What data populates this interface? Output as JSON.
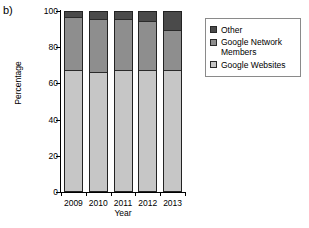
{
  "panel": {
    "label": "b)"
  },
  "chart_data": {
    "type": "bar",
    "subtype": "stacked-100-percent",
    "title": "",
    "xlabel": "Year",
    "ylabel": "Percentage",
    "categories": [
      "2009",
      "2010",
      "2011",
      "2012",
      "2013"
    ],
    "ylim": [
      0,
      100
    ],
    "yticks": [
      0,
      20,
      40,
      60,
      80,
      100
    ],
    "ytick_labels": [
      "0",
      "20",
      "40",
      "60",
      "80",
      "100"
    ],
    "grid": false,
    "legend_position": "right",
    "series": [
      {
        "name": "Google Websites",
        "color": "#c6c6c6",
        "values": [
          67,
          66,
          67,
          67,
          67
        ]
      },
      {
        "name": "Google Network Members",
        "color": "#8e8e8e",
        "values": [
          30,
          30,
          29,
          28,
          23
        ]
      },
      {
        "name": "Other",
        "color": "#4a4a4a",
        "values": [
          3,
          4,
          4,
          5,
          10
        ]
      }
    ],
    "stack_order_bottom_to_top": [
      "Google Websites",
      "Google Network Members",
      "Other"
    ]
  },
  "legend": {
    "items": [
      {
        "label": "Other",
        "color": "#4a4a4a"
      },
      {
        "label": "Google Network Members",
        "color": "#8e8e8e"
      },
      {
        "label": "Google Websites",
        "color": "#c6c6c6"
      }
    ]
  }
}
